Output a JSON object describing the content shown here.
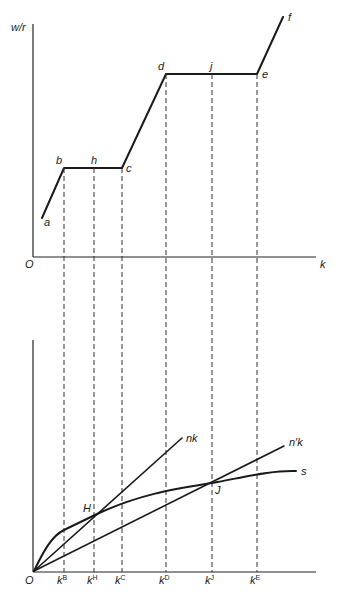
{
  "figure": {
    "top_panel": {
      "y_axis_label": "w/r",
      "x_axis_label": "k",
      "origin_label": "O",
      "points": {
        "a": "a",
        "b": "b",
        "h": "h",
        "c": "c",
        "d": "d",
        "j": "j",
        "e": "e",
        "f": "f"
      },
      "description": "Piecewise wage-rental ratio vs capital intensity: rising segments a-b, c-d, e-f and flat segments b-c (through h) and d-e (through j)"
    },
    "bottom_panel": {
      "origin_label": "O",
      "curves": {
        "nk": "nk",
        "n_prime_k": "n′k",
        "s": "s"
      },
      "intersections": {
        "H": "H",
        "J": "J"
      },
      "ticks": [
        {
          "base": "k",
          "sup": "B"
        },
        {
          "base": "k",
          "sup": "H"
        },
        {
          "base": "k",
          "sup": "C"
        },
        {
          "base": "k",
          "sup": "D"
        },
        {
          "base": "k",
          "sup": "J"
        },
        {
          "base": "k",
          "sup": "E"
        }
      ]
    },
    "colors": {
      "ink": "#1a1a1a",
      "background": "#ffffff"
    }
  }
}
